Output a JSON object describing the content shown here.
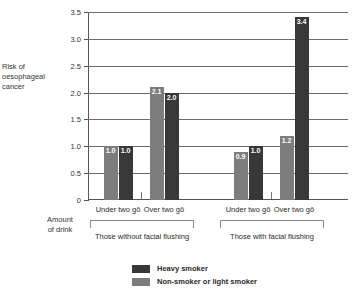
{
  "chart_data": {
    "type": "bar",
    "title": "",
    "xlabel": "Amount of drink",
    "ylabel": "Risk of oesophageal cancer",
    "ylim": [
      0,
      3.5
    ],
    "yticks": [
      "0",
      "0.5",
      "1.0",
      "1.5",
      "2.0",
      "2.5",
      "3.0",
      "3.5"
    ],
    "ytick_values": [
      0,
      0.5,
      1.0,
      1.5,
      2.0,
      2.5,
      3.0,
      3.5
    ],
    "grid": true,
    "legend_position": "bottom-center",
    "categories": [
      "Under two gō",
      "Over two gō",
      "Under two gō",
      "Over two gō"
    ],
    "groups": [
      {
        "label": "Those without facial flushing",
        "categories": [
          "Under two gō",
          "Over two gō"
        ]
      },
      {
        "label": "Those with facial flushing",
        "categories": [
          "Under two gō",
          "Over two gō"
        ]
      }
    ],
    "series": [
      {
        "name": "Non-smoker or light smoker",
        "color": "#7d7d7d",
        "values": [
          1.0,
          2.1,
          0.9,
          1.2
        ]
      },
      {
        "name": "Heavy smoker",
        "color": "#383838",
        "values": [
          1.0,
          2.0,
          1.0,
          3.4
        ]
      }
    ],
    "data_labels": [
      [
        "1.0",
        "2.1",
        "0.9",
        "1.2"
      ],
      [
        "1.0",
        "2.0",
        "1.0",
        "3.4"
      ]
    ]
  },
  "ylabel_lines": [
    "Risk of",
    "oesophageal",
    "cancer"
  ],
  "xlabel_lines": [
    "Amount",
    "of drink"
  ],
  "legend": {
    "items": [
      {
        "label": "Heavy smoker",
        "swatch": "dark"
      },
      {
        "label": "Non-smoker or light smoker",
        "swatch": "light"
      }
    ]
  }
}
